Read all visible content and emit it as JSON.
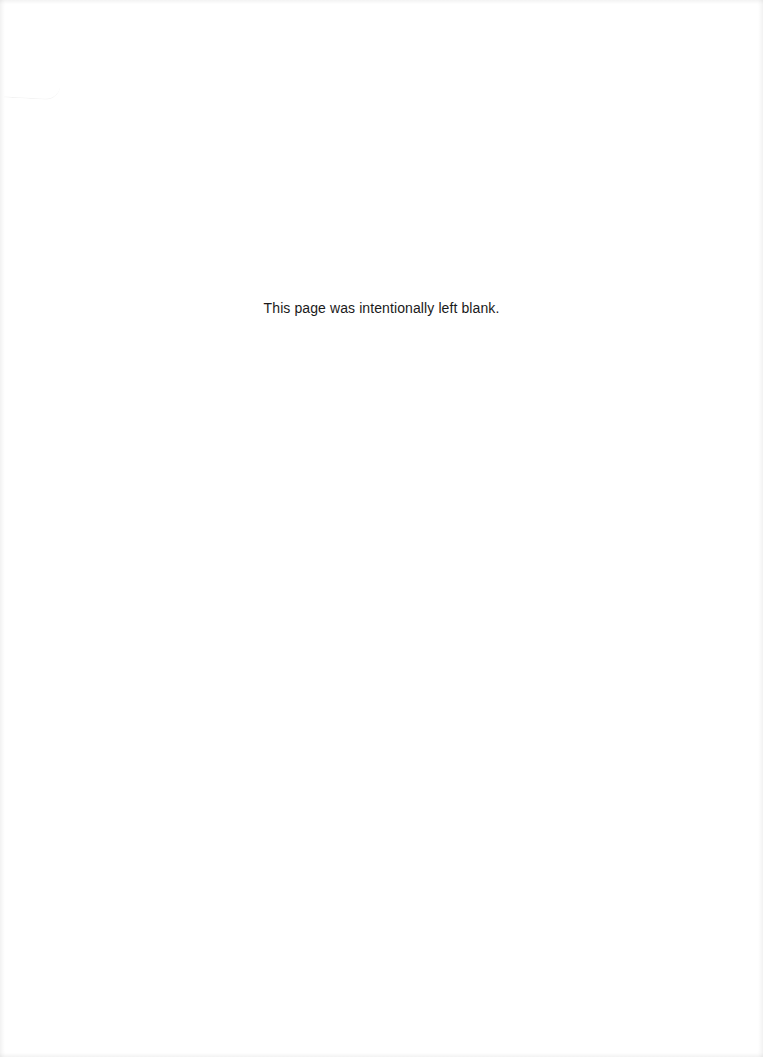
{
  "page": {
    "notice_text": "This page was intentionally left blank.",
    "background_color": "#ffffff",
    "text_color": "#1a1a1a"
  }
}
